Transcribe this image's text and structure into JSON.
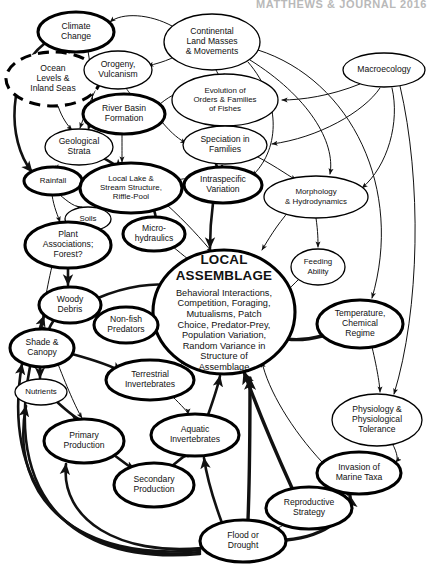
{
  "figure": {
    "header_watermark": "MATTHEWS & JOURNAL 2016",
    "central_node_title_line1": "LOCAL",
    "central_node_title_line2": "ASSEMBLAGE",
    "central_node_body": [
      "Behavioral Interactions,",
      "Competition, Foraging,",
      "Mutualisms, Patch",
      "Choice, Predator-Prey,",
      "Population Variation,",
      "Random Variance in",
      "Structure of",
      "Assemblage"
    ]
  },
  "nodes": [
    {
      "id": "climate_change",
      "label": [
        "Climate",
        "Change"
      ],
      "cx": 76,
      "cy": 32,
      "rx": 38,
      "ry": 20,
      "style": "bold"
    },
    {
      "id": "ocean_levels",
      "label": [
        "Ocean",
        "Levels &",
        "Inland Seas"
      ],
      "cx": 53,
      "cy": 79,
      "rx": 47,
      "ry": 27,
      "style": "dashed"
    },
    {
      "id": "orogeny_vulcanism",
      "label": [
        "Orogeny,",
        "Vulcanism"
      ],
      "cx": 118,
      "cy": 70,
      "rx": 34,
      "ry": 19,
      "style": "thin"
    },
    {
      "id": "continental_masses",
      "label": [
        "Continental",
        "Land Masses",
        "& Movements"
      ],
      "cx": 212,
      "cy": 42,
      "rx": 48,
      "ry": 28,
      "style": "thin"
    },
    {
      "id": "macroecology",
      "label": [
        "Macroecology"
      ],
      "cx": 384,
      "cy": 70,
      "rx": 41,
      "ry": 17,
      "style": "thin"
    },
    {
      "id": "river_basin",
      "label": [
        "River Basin",
        "Formation"
      ],
      "cx": 124,
      "cy": 114,
      "rx": 41,
      "ry": 20,
      "style": "bold"
    },
    {
      "id": "evolution_orders",
      "label": [
        "Evolution of",
        "Orders & Families",
        "of Fishes"
      ],
      "cx": 225,
      "cy": 100,
      "rx": 53,
      "ry": 26,
      "style": "thin"
    },
    {
      "id": "geological_strata",
      "label": [
        "Geological",
        "Strata"
      ],
      "cx": 79,
      "cy": 147,
      "rx": 34,
      "ry": 18,
      "style": "thin"
    },
    {
      "id": "speciation",
      "label": [
        "Speciation in",
        "Families"
      ],
      "cx": 225,
      "cy": 145,
      "rx": 42,
      "ry": 19,
      "style": "thin"
    },
    {
      "id": "rainfall",
      "label": [
        "Rainfall"
      ],
      "cx": 53,
      "cy": 181,
      "rx": 29,
      "ry": 14,
      "style": "bold"
    },
    {
      "id": "local_lake",
      "label": [
        "Local Lake &",
        "Stream Structure,",
        "Riffle-Pool"
      ],
      "cx": 131,
      "cy": 188,
      "rx": 51,
      "ry": 25,
      "style": "bold"
    },
    {
      "id": "intraspecific",
      "label": [
        "Intraspecific",
        "Variation"
      ],
      "cx": 223,
      "cy": 185,
      "rx": 39,
      "ry": 18,
      "style": "bold"
    },
    {
      "id": "morphology",
      "label": [
        "Morphology",
        "& Hydrodynamics"
      ],
      "cx": 316,
      "cy": 197,
      "rx": 52,
      "ry": 21,
      "style": "thin"
    },
    {
      "id": "soils",
      "label": [
        "Soils"
      ],
      "cx": 88,
      "cy": 219,
      "rx": 23,
      "ry": 12,
      "style": "thin"
    },
    {
      "id": "micro_hydraulics",
      "label": [
        "Micro-",
        "hydraulics"
      ],
      "cx": 154,
      "cy": 234,
      "rx": 31,
      "ry": 17,
      "style": "bold"
    },
    {
      "id": "plant_associations",
      "label": [
        "Plant",
        "Associations;",
        "Forest?"
      ],
      "cx": 68,
      "cy": 245,
      "rx": 43,
      "ry": 23,
      "style": "bold"
    },
    {
      "id": "local_assemblage",
      "label": [],
      "cx": 224,
      "cy": 312,
      "rx": 71,
      "ry": 62,
      "style": "bold"
    },
    {
      "id": "feeding_ability",
      "label": [
        "Feeding",
        "Ability"
      ],
      "cx": 318,
      "cy": 267,
      "rx": 27,
      "ry": 18,
      "style": "thin"
    },
    {
      "id": "woody_debris",
      "label": [
        "Woody",
        "Debris"
      ],
      "cx": 70,
      "cy": 305,
      "rx": 31,
      "ry": 18,
      "style": "bold"
    },
    {
      "id": "non_fish_predators",
      "label": [
        "Non-fish",
        "Predators"
      ],
      "cx": 126,
      "cy": 325,
      "rx": 32,
      "ry": 18,
      "style": "bold"
    },
    {
      "id": "temperature_chem",
      "label": [
        "Temperature,",
        "Chemical",
        "Regime"
      ],
      "cx": 360,
      "cy": 324,
      "rx": 43,
      "ry": 24,
      "style": "bold"
    },
    {
      "id": "shade_canopy",
      "label": [
        "Shade &",
        "Canopy"
      ],
      "cx": 42,
      "cy": 348,
      "rx": 32,
      "ry": 19,
      "style": "bold"
    },
    {
      "id": "terrestrial_inverts",
      "label": [
        "Terrestrial",
        "Invertebrates"
      ],
      "cx": 150,
      "cy": 380,
      "rx": 44,
      "ry": 20,
      "style": "bold"
    },
    {
      "id": "nutrients",
      "label": [
        "Nutrients"
      ],
      "cx": 41,
      "cy": 392,
      "rx": 26,
      "ry": 13,
      "style": "thin"
    },
    {
      "id": "aquatic_inverts",
      "label": [
        "Aquatic",
        "Invertebrates"
      ],
      "cx": 195,
      "cy": 435,
      "rx": 44,
      "ry": 21,
      "style": "bold"
    },
    {
      "id": "physiology",
      "label": [
        "Physiology &",
        "Physiological",
        "Tolerance"
      ],
      "cx": 377,
      "cy": 420,
      "rx": 45,
      "ry": 26,
      "style": "thin"
    },
    {
      "id": "primary_production",
      "label": [
        "Primary",
        "Production"
      ],
      "cx": 84,
      "cy": 441,
      "rx": 40,
      "ry": 22,
      "style": "bold"
    },
    {
      "id": "secondary_production",
      "label": [
        "Secondary",
        "Production"
      ],
      "cx": 154,
      "cy": 485,
      "rx": 40,
      "ry": 22,
      "style": "bold"
    },
    {
      "id": "invasion_marine",
      "label": [
        "Invasion of",
        "Marine Taxa"
      ],
      "cx": 359,
      "cy": 473,
      "rx": 42,
      "ry": 21,
      "style": "bold"
    },
    {
      "id": "reproductive_strategy",
      "label": [
        "Reproductive",
        "Strategy"
      ],
      "cx": 309,
      "cy": 508,
      "rx": 43,
      "ry": 21,
      "style": "bold"
    },
    {
      "id": "flood_drought",
      "label": [
        "Flood or",
        "Drought"
      ],
      "cx": 243,
      "cy": 541,
      "rx": 43,
      "ry": 21,
      "style": "bold"
    }
  ],
  "edges": [
    {
      "from": "continental_masses",
      "to": "climate_change",
      "d": "M 172 26 C 150 14 122 12 110 22",
      "w": "thin"
    },
    {
      "from": "continental_masses",
      "to": "orogeny_vulcanism",
      "d": "M 180 54 C 166 62 154 64 148 66",
      "w": "thin"
    },
    {
      "from": "continental_masses",
      "to": "evolution_orders",
      "d": "M 216 70 C 220 78 222 80 224 74",
      "w": "thin"
    },
    {
      "from": "climate_change",
      "to": "ocean_levels",
      "d": "M 70 52 C 66 58 64 62 62 54",
      "w": "thin"
    },
    {
      "from": "climate_change",
      "to": "geological_strata",
      "d": "M 88 51 C 94 86 94 112 88 130",
      "w": "thin"
    },
    {
      "from": "climate_change",
      "to": "rainfall",
      "d": "M 44 44 C 8 72 6 140 32 172",
      "w": "bold"
    },
    {
      "from": "ocean_levels",
      "to": "geological_strata",
      "d": "M 58 106 C 62 118 68 126 72 130",
      "w": "thin"
    },
    {
      "from": "orogeny_vulcanism",
      "to": "geological_strata",
      "d": "M 98 84 C 90 102 84 116 80 128",
      "w": "thin"
    },
    {
      "from": "orogeny_vulcanism",
      "to": "river_basin",
      "d": "M 126 88 C 130 94 132 96 130 93",
      "w": "thin"
    },
    {
      "from": "river_basin",
      "to": "evolution_orders",
      "d": "M 160 104 C 172 94 182 90 190 92",
      "w": "thin"
    },
    {
      "from": "river_basin",
      "to": "speciation",
      "d": "M 162 122 C 172 134 180 140 186 143",
      "w": "thin"
    },
    {
      "from": "river_basin",
      "to": "local_lake",
      "d": "M 122 135 C 122 146 122 156 122 162",
      "w": "thin"
    },
    {
      "from": "geological_strata",
      "to": "local_lake",
      "d": "M 100 156 C 110 162 118 166 122 170",
      "w": "bold"
    },
    {
      "from": "geological_strata",
      "to": "rainfall",
      "d": "M 58 165 C 56 170 56 172 56 166",
      "w": "thin"
    },
    {
      "from": "evolution_orders",
      "to": "speciation",
      "d": "M 212 126 C 214 132 216 134 218 126",
      "w": "thin"
    },
    {
      "from": "speciation",
      "to": "intraspecific",
      "d": "M 216 164 C 218 170 220 172 222 166",
      "w": "bold"
    },
    {
      "from": "speciation",
      "to": "morphology",
      "d": "M 252 154 C 272 164 286 174 296 180",
      "w": "thin"
    },
    {
      "from": "intraspecific",
      "to": "local_assemblage",
      "d": "M 213 203 C 211 218 210 232 210 248",
      "w": "bold"
    },
    {
      "from": "morphology",
      "to": "local_assemblage",
      "d": "M 290 210 C 276 226 268 240 262 250",
      "w": "thin"
    },
    {
      "from": "morphology",
      "to": "feeding_ability",
      "d": "M 316 218 C 318 232 318 240 318 247",
      "w": "thin"
    },
    {
      "from": "rainfall",
      "to": "soils",
      "d": "M 60 195 C 68 202 76 208 82 207",
      "w": "thin"
    },
    {
      "from": "rainfall",
      "to": "plant_associations",
      "d": "M 52 195 C 54 208 58 216 60 222",
      "w": "thin"
    },
    {
      "from": "rainfall",
      "to": "local_lake",
      "d": "M 80 186 C 92 188 100 190 104 192",
      "w": "bold"
    },
    {
      "from": "local_lake",
      "to": "micro_hydraulics",
      "d": "M 154 210 C 156 216 156 220 156 217",
      "w": "bold"
    },
    {
      "from": "local_lake",
      "to": "intraspecific",
      "d": "M 178 180 C 186 178 190 178 186 180",
      "w": "thin"
    },
    {
      "from": "local_lake",
      "to": "local_assemblage",
      "d": "M 166 204 C 186 222 202 240 212 252",
      "w": "thin"
    },
    {
      "from": "micro_hydraulics",
      "to": "local_assemblage",
      "d": "M 172 246 C 184 256 194 264 200 268",
      "w": "thin"
    },
    {
      "from": "soils",
      "to": "plant_associations",
      "d": "M 80 229 C 78 234 76 236 76 230",
      "w": "thin"
    },
    {
      "from": "plant_associations",
      "to": "woody_debris",
      "d": "M 68 268 C 68 278 68 284 68 285",
      "w": "bold"
    },
    {
      "from": "plant_associations",
      "to": "shade_canopy",
      "d": "M 52 266 C 46 292 42 316 42 327",
      "w": "thin"
    },
    {
      "from": "woody_debris",
      "to": "non_fish_predators",
      "d": "M 98 312 C 106 316 110 318 108 318",
      "w": "thin"
    },
    {
      "from": "woody_debris",
      "to": "local_assemblage",
      "d": "M 98 298 C 126 286 156 282 172 286",
      "w": "bold"
    },
    {
      "from": "woody_debris",
      "to": "shade_canopy",
      "d": "M 54 320 C 50 326 48 330 50 330",
      "w": "bold"
    },
    {
      "from": "non_fish_predators",
      "to": "local_assemblage",
      "d": "M 154 318 C 166 312 174 310 178 310",
      "w": "bold"
    },
    {
      "from": "shade_canopy",
      "to": "nutrients",
      "d": "M 40 367 C 40 374 40 378 40 378",
      "w": "bold"
    },
    {
      "from": "shade_canopy",
      "to": "terrestrial_inverts",
      "d": "M 72 354 C 94 360 112 366 122 372",
      "w": "bold"
    },
    {
      "from": "shade_canopy",
      "to": "primary_production",
      "d": "M 58 364 C 68 390 78 412 82 418",
      "w": "thin"
    },
    {
      "from": "nutrients",
      "to": "primary_production",
      "d": "M 56 401 C 68 412 78 420 82 420",
      "w": "bold"
    },
    {
      "from": "terrestrial_inverts",
      "to": "local_assemblage",
      "d": "M 176 368 C 192 356 200 348 200 344",
      "w": "thin"
    },
    {
      "from": "terrestrial_inverts",
      "to": "aquatic_inverts",
      "d": "M 172 396 C 182 406 188 412 188 414",
      "w": "thin"
    },
    {
      "from": "primary_production",
      "to": "secondary_production",
      "d": "M 114 455 C 126 464 134 470 136 471",
      "w": "bold"
    },
    {
      "from": "secondary_production",
      "to": "aquatic_inverts",
      "d": "M 172 466 C 182 458 186 454 188 456",
      "w": "bold"
    },
    {
      "from": "aquatic_inverts",
      "to": "local_assemblage",
      "d": "M 208 415 C 214 398 218 386 220 376",
      "w": "bold"
    },
    {
      "from": "flood_drought",
      "to": "aquatic_inverts",
      "d": "M 222 523 C 212 496 206 472 204 458",
      "w": "bold"
    },
    {
      "from": "flood_drought",
      "to": "local_assemblage",
      "d": "M 248 520 C 250 468 250 420 250 378",
      "w": "xbold"
    },
    {
      "from": "flood_drought",
      "to": "reproductive_strategy",
      "d": "M 274 530 C 286 524 292 520 290 522",
      "w": "thin"
    },
    {
      "from": "flood_drought",
      "to": "invasion_marine",
      "d": "M 286 540 C 330 536 352 512 350 496",
      "w": "xbold"
    },
    {
      "from": "flood_drought",
      "to": "primary_production",
      "d": "M 202 548 C 120 556 60 520 66 464",
      "w": "bold"
    },
    {
      "from": "flood_drought",
      "to": "nutrients",
      "d": "M 200 550 C 80 562 8 500 26 406",
      "w": "bold"
    },
    {
      "from": "flood_drought",
      "to": "shade_canopy",
      "d": "M 200 552 C 60 566 2 480 22 364",
      "w": "bold"
    },
    {
      "from": "flood_drought",
      "to": "woody_debris",
      "d": "M 200 554 C 40 568 -6 460 44 316",
      "w": "bold"
    },
    {
      "from": "reproductive_strategy",
      "to": "invasion_marine",
      "d": "M 348 494 C 352 492 352 492 350 494",
      "w": "xbold"
    },
    {
      "from": "reproductive_strategy",
      "to": "local_assemblage",
      "d": "M 292 488 C 272 444 252 394 244 372",
      "w": "xbold"
    },
    {
      "from": "temperature_chem",
      "to": "local_assemblage",
      "d": "M 322 336 C 300 342 280 340 270 334",
      "w": "xbold"
    },
    {
      "from": "temperature_chem",
      "to": "physiology",
      "d": "M 372 347 C 378 372 380 388 380 392",
      "w": "thin"
    },
    {
      "from": "physiology",
      "to": "invasion_marine",
      "d": "M 392 443 C 398 454 398 460 396 462",
      "w": "thin"
    },
    {
      "from": "invasion_marine",
      "to": "local_assemblage",
      "d": "M 322 462 C 292 430 268 390 262 362",
      "w": "thin"
    },
    {
      "from": "feeding_ability",
      "to": "local_assemblage",
      "d": "M 300 278 C 288 290 280 298 276 300",
      "w": "thin"
    },
    {
      "from": "macroecology",
      "to": "evolution_orders",
      "d": "M 360 84 C 330 96 302 100 282 100",
      "w": "thin"
    },
    {
      "from": "macroecology",
      "to": "speciation",
      "d": "M 380 88 C 364 112 318 138 272 144",
      "w": "thin"
    },
    {
      "from": "macroecology",
      "to": "morphology",
      "d": "M 392 88 C 400 122 388 166 362 188",
      "w": "thin"
    },
    {
      "from": "continental_masses",
      "to": "morphology",
      "d": "M 250 60 C 308 96 336 142 330 174",
      "w": "thin"
    },
    {
      "from": "continental_masses",
      "to": "temperature_chem",
      "d": "M 258 50 C 352 80 404 190 372 298",
      "w": "thin"
    },
    {
      "from": "continental_masses",
      "to": "intraspecific",
      "d": "M 248 62 C 284 104 278 152 252 176",
      "w": "thin"
    },
    {
      "from": "macroecology",
      "to": "physiology",
      "d": "M 400 86 C 422 180 420 310 394 394",
      "w": "thin"
    }
  ],
  "legend": {
    "note": "Arrows indicate direction of causal influence; bold outlines denote strongly-coupled variables; dashed outline denotes a long-timescale driver."
  }
}
